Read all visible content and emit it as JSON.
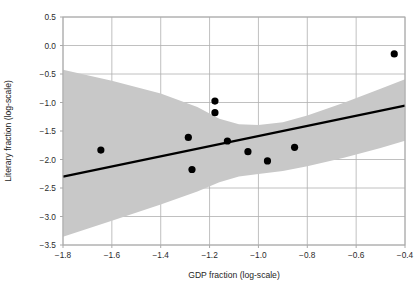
{
  "chart_data": {
    "type": "scatter",
    "title": "",
    "xlabel": "GDP fraction (log-scale)",
    "ylabel": "Literary fraction (log-scale)",
    "xlim": [
      -1.8,
      -0.4
    ],
    "ylim": [
      -3.5,
      0.5
    ],
    "xticks": [
      -1.8,
      -1.6,
      -1.4,
      -1.2,
      -1.0,
      -0.8,
      -0.6,
      -0.4
    ],
    "yticks": [
      0.5,
      0.0,
      -0.5,
      -1.0,
      -1.5,
      -2.0,
      -2.5,
      -3.0,
      -3.5
    ],
    "xtick_labels": [
      "−1.8",
      "−1.6",
      "−1.4",
      "−1.2",
      "−1.0",
      "−0.8",
      "−0.6",
      "−0.4"
    ],
    "ytick_labels": [
      "0.5",
      "0.0",
      "−0.5",
      "−1.0",
      "−1.5",
      "−2.0",
      "−2.5",
      "−3.0",
      "−3.5"
    ],
    "grid": true,
    "legend": "none",
    "points": [
      {
        "x": -1.645,
        "y": -1.835
      },
      {
        "x": -1.287,
        "y": -1.612
      },
      {
        "x": -1.272,
        "y": -2.175
      },
      {
        "x": -1.178,
        "y": -0.975
      },
      {
        "x": -1.178,
        "y": -1.178
      },
      {
        "x": -1.127,
        "y": -1.675
      },
      {
        "x": -1.043,
        "y": -1.862
      },
      {
        "x": -0.963,
        "y": -2.025
      },
      {
        "x": -0.852,
        "y": -1.787
      },
      {
        "x": -0.444,
        "y": -0.147
      }
    ],
    "fit_line": {
      "x_start": -1.8,
      "y_start": -2.3,
      "x_end": -0.4,
      "y_end": -1.055
    },
    "confidence_band": {
      "upper": [
        {
          "x": -1.8,
          "y": -0.425
        },
        {
          "x": -1.6,
          "y": -0.62
        },
        {
          "x": -1.4,
          "y": -0.84
        },
        {
          "x": -1.25,
          "y": -1.08
        },
        {
          "x": -1.16,
          "y": -1.285
        },
        {
          "x": -1.08,
          "y": -1.38
        },
        {
          "x": -1.0,
          "y": -1.395
        },
        {
          "x": -0.9,
          "y": -1.345
        },
        {
          "x": -0.8,
          "y": -1.23
        },
        {
          "x": -0.65,
          "y": -1.005
        },
        {
          "x": -0.5,
          "y": -0.76
        },
        {
          "x": -0.4,
          "y": -0.59
        }
      ],
      "lower": [
        {
          "x": -1.8,
          "y": -3.355
        },
        {
          "x": -1.6,
          "y": -3.075
        },
        {
          "x": -1.4,
          "y": -2.79
        },
        {
          "x": -1.25,
          "y": -2.56
        },
        {
          "x": -1.16,
          "y": -2.4
        },
        {
          "x": -1.08,
          "y": -2.3
        },
        {
          "x": -1.0,
          "y": -2.255
        },
        {
          "x": -0.9,
          "y": -2.2
        },
        {
          "x": -0.8,
          "y": -2.12
        },
        {
          "x": -0.65,
          "y": -1.97
        },
        {
          "x": -0.5,
          "y": -1.8
        },
        {
          "x": -0.4,
          "y": -1.67
        }
      ]
    },
    "colors": {
      "point": "#000000",
      "line": "#000000",
      "band": "#c8c8c8",
      "grid": "#b0b0b0",
      "axis": "#aaaaaa",
      "text": "#262626",
      "background": "#ffffff"
    }
  }
}
